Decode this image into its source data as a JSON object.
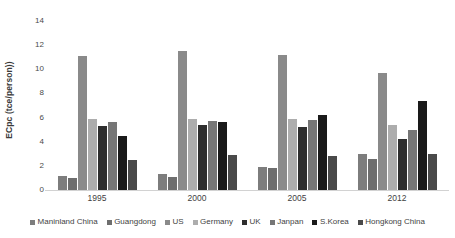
{
  "chart_data": {
    "type": "bar",
    "title": "",
    "xlabel": "",
    "ylabel": "ECpc (tce/person))",
    "categories": [
      "1995",
      "2000",
      "2005",
      "2012"
    ],
    "ylim": [
      0,
      14
    ],
    "yticks": [
      0,
      2,
      4,
      6,
      8,
      10,
      12,
      14
    ],
    "ytick_labels": [
      "0",
      "2",
      "4",
      "6",
      "8",
      "10",
      "12",
      "14"
    ],
    "grid": false,
    "legend_position": "bottom",
    "series": [
      {
        "name": "Maninland China",
        "color": "#7d7d7d",
        "values": [
          1.2,
          1.3,
          1.9,
          3.0
        ]
      },
      {
        "name": "Guangdong",
        "color": "#6e6e6e",
        "values": [
          1.0,
          1.1,
          1.8,
          2.6
        ]
      },
      {
        "name": "US",
        "color": "#8a8a8a",
        "values": [
          11.1,
          11.5,
          11.2,
          9.7
        ]
      },
      {
        "name": "Germany",
        "color": "#adadad",
        "values": [
          5.9,
          5.9,
          5.9,
          5.4
        ]
      },
      {
        "name": "UK",
        "color": "#2e2e2e",
        "values": [
          5.3,
          5.4,
          5.2,
          4.2
        ]
      },
      {
        "name": "Janpan",
        "color": "#767676",
        "values": [
          5.6,
          5.7,
          5.8,
          5.0
        ]
      },
      {
        "name": "S.Korea",
        "color": "#1a1a1a",
        "values": [
          4.5,
          5.6,
          6.2,
          7.4
        ]
      },
      {
        "name": "Hongkong China",
        "color": "#4a4a4a",
        "values": [
          2.5,
          2.9,
          2.8,
          3.0
        ]
      }
    ]
  }
}
